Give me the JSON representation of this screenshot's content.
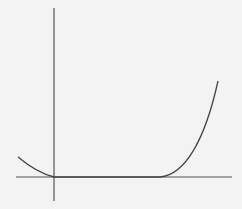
{
  "diagram": {
    "type": "function-graph",
    "colors": {
      "background": "#f3f3f3",
      "axes": "#555555",
      "curve": "#444444"
    },
    "axes": {
      "x_axis": {
        "x1": 16,
        "y1": 177,
        "x2": 232,
        "y2": 177
      },
      "y_axis": {
        "x1": 54,
        "y1": 8,
        "x2": 54,
        "y2": 201
      }
    },
    "curve_segments": [
      {
        "name": "left-decreasing",
        "path": "M18,157 C30,167 42,174 54,177"
      },
      {
        "name": "flat-zero",
        "path": "M54,177 L160,177"
      },
      {
        "name": "right-increasing",
        "path": "M160,177 C185,175 205,140 218,81"
      }
    ]
  }
}
